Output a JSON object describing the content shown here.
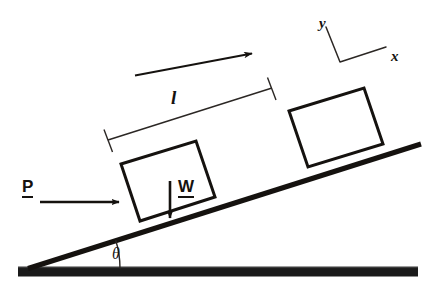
{
  "diagram": {
    "type": "physics-free-body-diagram",
    "colors": {
      "ink": "#15120f",
      "ground": "#1a1a1a",
      "background": "#ffffff",
      "thin_line": "#2b2724"
    },
    "labels": {
      "force_p": "P",
      "weight_w": "W",
      "distance_l": "l",
      "axis_x": "x",
      "axis_y": "y",
      "angle_theta": "θ"
    },
    "geometry": {
      "incline_angle_deg": 17.5,
      "ground_bar": {
        "x1": 18,
        "x2": 418,
        "y": 272,
        "thickness": 9
      },
      "incline_line": {
        "x1": 28,
        "y1": 268,
        "x2": 421,
        "y2": 144,
        "thickness": 5
      },
      "block_initial": {
        "corners": [
          [
            121,
            164
          ],
          [
            196,
            141
          ],
          [
            215,
            197
          ],
          [
            140,
            221
          ]
        ],
        "stroke": 3
      },
      "block_final": {
        "corners": [
          [
            289,
            111
          ],
          [
            364,
            88
          ],
          [
            383,
            144
          ],
          [
            308,
            167
          ]
        ],
        "stroke": 3
      },
      "force_p_arrow": {
        "x1": 40,
        "y1": 202,
        "x2": 120,
        "y2": 202,
        "thickness": 2.6
      },
      "weight_w_arrow": {
        "x1": 170,
        "y1": 182,
        "x2": 170,
        "y2": 219,
        "thickness": 2.6
      },
      "motion_arrow": {
        "x1": 135,
        "y1": 75,
        "x2": 254,
        "y2": 53,
        "thickness": 1.8
      },
      "dimension_line": {
        "x1": 108,
        "y1": 140,
        "x2": 272,
        "y2": 88,
        "thickness": 1.4
      },
      "dimension_tick_left": {
        "x1": 103,
        "y1": 130,
        "x2": 113,
        "y2": 152
      },
      "dimension_tick_right": {
        "x1": 267,
        "y1": 78,
        "x2": 277,
        "y2": 100
      },
      "axes": {
        "vertex": [
          340,
          62
        ],
        "x_end": [
          386,
          47
        ],
        "y_end": [
          325,
          26
        ]
      },
      "theta_arc": {
        "cx": 28,
        "cy": 268,
        "radius": 92,
        "start_deg": 0,
        "end_deg": -17.5
      }
    }
  }
}
